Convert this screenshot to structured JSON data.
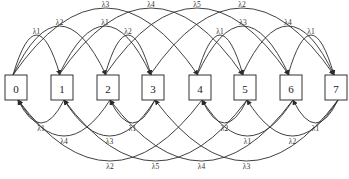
{
  "diagram": {
    "type": "state-transition-diagram",
    "node_color": "#ffffff",
    "stroke_color": "#2b2b2b",
    "nodes": [
      {
        "id": "0",
        "label": "0",
        "cx": 16
      },
      {
        "id": "1",
        "label": "1",
        "cx": 62
      },
      {
        "id": "2",
        "label": "2",
        "cx": 108
      },
      {
        "id": "3",
        "label": "3",
        "cx": 153
      },
      {
        "id": "4",
        "label": "4",
        "cx": 200
      },
      {
        "id": "5",
        "label": "5",
        "cx": 245
      },
      {
        "id": "6",
        "label": "6",
        "cx": 291
      },
      {
        "id": "7",
        "label": "7",
        "cx": 336
      }
    ],
    "forward_edges": [
      {
        "from": "0",
        "to": "1",
        "label": "λ1",
        "label_y": 31
      },
      {
        "from": "0",
        "to": "2",
        "label": "λ2",
        "label_y": 22
      },
      {
        "from": "0",
        "to": "4",
        "label": "λ3",
        "label_y": 4
      },
      {
        "from": "1",
        "to": "3",
        "label": "λ1",
        "label_y": 22
      },
      {
        "from": "1",
        "to": "5",
        "label": "λ4",
        "label_y": 4
      },
      {
        "from": "2",
        "to": "3",
        "label": "λ2",
        "label_y": 31
      },
      {
        "from": "2",
        "to": "6",
        "label": "λ5",
        "label_y": 4
      },
      {
        "from": "3",
        "to": "7",
        "label": "λ2",
        "label_y": 4
      },
      {
        "from": "4",
        "to": "5",
        "label": "λ1",
        "label_y": 31
      },
      {
        "from": "4",
        "to": "6",
        "label": "λ3",
        "label_y": 22
      },
      {
        "from": "5",
        "to": "7",
        "label": "λ4",
        "label_y": 22
      },
      {
        "from": "6",
        "to": "7",
        "label": "λ1",
        "label_y": 31
      }
    ],
    "backward_edges": [
      {
        "from": "1",
        "to": "0",
        "label": "λ1",
        "label_y": 128
      },
      {
        "from": "2",
        "to": "0",
        "label": "λ4",
        "label_y": 141
      },
      {
        "from": "4",
        "to": "0",
        "label": "λ2",
        "label_y": 166
      },
      {
        "from": "3",
        "to": "2",
        "label": "λ1",
        "label_y": 128
      },
      {
        "from": "3",
        "to": "1",
        "label": "λ3",
        "label_y": 141
      },
      {
        "from": "5",
        "to": "1",
        "label": "λ5",
        "label_y": 166
      },
      {
        "from": "5",
        "to": "4",
        "label": "λ2",
        "label_y": 128
      },
      {
        "from": "6",
        "to": "4",
        "label": "λ1",
        "label_y": 141
      },
      {
        "from": "6",
        "to": "2",
        "label": "λ4",
        "label_y": 166
      },
      {
        "from": "7",
        "to": "6",
        "label": "λ1",
        "label_y": 128
      },
      {
        "from": "7",
        "to": "5",
        "label": "λ2",
        "label_y": 141
      },
      {
        "from": "7",
        "to": "3",
        "label": "λ3",
        "label_y": 166
      }
    ]
  }
}
